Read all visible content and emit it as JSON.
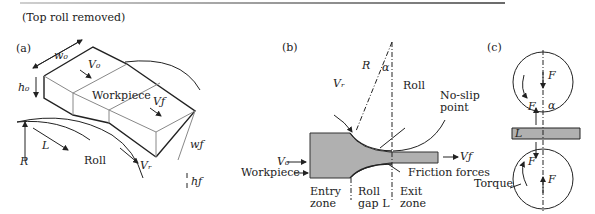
{
  "header": {
    "note": "(Top roll removed)"
  },
  "panels": [
    {
      "id": "a",
      "label": "(a)",
      "labels": {
        "w0": "w₀",
        "V0": "V₀",
        "h0": "h₀",
        "workpiece": "Workpiece",
        "Vf": "Vƒ",
        "R": "R",
        "L": "L",
        "roll": "Roll",
        "Vr": "Vᵣ",
        "wf": "wƒ",
        "hf": "hƒ"
      }
    },
    {
      "id": "b",
      "label": "(b)",
      "labels": {
        "R": "R",
        "alpha": "α",
        "Vr": "Vᵣ",
        "roll": "Roll",
        "no_slip_1": "No-slip",
        "no_slip_2": "point",
        "V0": "V₀",
        "Vf": "Vƒ",
        "workpiece": "Workpiece",
        "friction": "Friction forces",
        "entry_1": "Entry",
        "entry_2": "zone",
        "gap_1": "Roll",
        "gap_2": "gap L",
        "exit_1": "Exit",
        "exit_2": "zone"
      }
    },
    {
      "id": "c",
      "label": "(c)",
      "labels": {
        "F_top": "F",
        "F_left_top": "F",
        "alpha": "α",
        "L": "L",
        "F_left_bottom": "F",
        "F_bottom": "F",
        "torque": "Torque"
      }
    }
  ],
  "colors": {
    "workpiece_fill": "#b0b0b0",
    "line": "#222222"
  }
}
